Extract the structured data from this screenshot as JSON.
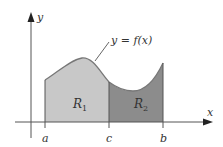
{
  "diagram": {
    "type": "area-under-curve",
    "curve_label": "y = f(x)",
    "axes": {
      "x_label": "x",
      "y_label": "y"
    },
    "ticks": [
      {
        "label": "a",
        "x": 45
      },
      {
        "label": "c",
        "x": 109
      },
      {
        "label": "b",
        "x": 163
      }
    ],
    "regions": [
      {
        "name": "R1",
        "base": "R",
        "sub": "1",
        "from": "a",
        "to": "c",
        "fill": "#c8c8c8"
      },
      {
        "name": "R2",
        "base": "R",
        "sub": "2",
        "from": "c",
        "to": "b",
        "fill": "#8c8c8c"
      }
    ],
    "colors": {
      "curve": "#777777",
      "axis": "#555555",
      "region1": "#c8c8c8",
      "region2": "#8c8c8c",
      "text": "#333333"
    }
  }
}
